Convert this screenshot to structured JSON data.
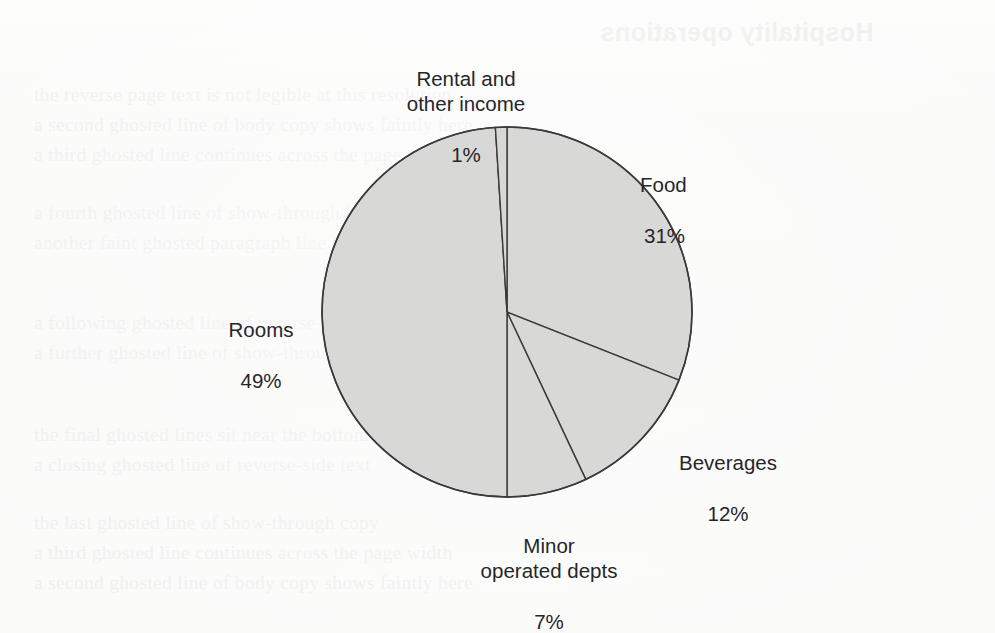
{
  "figure": {
    "kind": "pie-chart",
    "background_color": "#fbfbfa",
    "slice_fill_color": "#d8d8d6",
    "slice_stroke_color": "#3a3a3c",
    "label_text_color": "#26262a"
  },
  "chart_data": {
    "type": "pie",
    "title": "",
    "subtitle": "",
    "xlabel": "",
    "ylabel": "",
    "grid": false,
    "legend_position": "none",
    "labels_position": "outside",
    "start_angle_deg": 0,
    "direction": "clockwise",
    "units": "percent",
    "total": 100,
    "categories": [
      "Food",
      "Beverages",
      "Minor operated depts",
      "Rooms",
      "Rental and other income"
    ],
    "values": [
      31,
      12,
      7,
      49,
      1
    ],
    "slices": [
      {
        "name": "Food",
        "label_line1": "Food",
        "label_line2": "31%",
        "value": 31,
        "fill": "#d8d8d6",
        "stroke": "#3a3a3c"
      },
      {
        "name": "Beverages",
        "label_line1": "Beverages",
        "label_line2": "12%",
        "value": 12,
        "fill": "#d8d8d6",
        "stroke": "#3a3a3c"
      },
      {
        "name": "Minor operated depts",
        "label_line1": "Minor\noperated depts",
        "label_line2": "7%",
        "value": 7,
        "fill": "#d8d8d6",
        "stroke": "#3a3a3c"
      },
      {
        "name": "Rooms",
        "label_line1": "Rooms",
        "label_line2": "49%",
        "value": 49,
        "fill": "#d8d8d6",
        "stroke": "#3a3a3c"
      },
      {
        "name": "Rental and other income",
        "label_line1": "Rental and\nother income",
        "label_line2": "1%",
        "value": 1,
        "fill": "#d8d8d6",
        "stroke": "#3a3a3c"
      }
    ]
  },
  "showthrough": {
    "note": "Faint mirrored text bleeding through from the reverse side of the scanned page; not legible.",
    "title_ghost": "Hospitality operations",
    "lines": [
      "the reverse page text is not legible at this resolution",
      "a second ghosted line of body copy shows faintly here",
      "a third ghosted line continues across the page width",
      "a fourth ghosted line of show-through body copy",
      "another faint ghosted paragraph line appears lower",
      "a following ghosted line of reverse-side body copy",
      "a further ghosted line of show-through text",
      "the final ghosted lines sit near the bottom margin",
      "a closing ghosted line of reverse-side text",
      "the last ghosted line of show-through copy"
    ]
  }
}
